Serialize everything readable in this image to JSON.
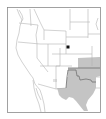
{
  "map": {
    "type": "range-map",
    "region": "Western and Central United States",
    "colors": {
      "background": "#ffffff",
      "frame": "#8a8a8a",
      "state_border": "#b4b4b4",
      "range_fill": "#c4c4c4",
      "range_border": "#6e6e6e",
      "marker": "#111111",
      "small_patch": "#e2e2e2"
    },
    "shaded_range": [
      "Kansas (southeast)",
      "Oklahoma",
      "Texas (north, central, west)"
    ],
    "marker": {
      "shape": "square",
      "location": "Nebraska/Colorado area",
      "x": 68,
      "y": 47
    }
  }
}
